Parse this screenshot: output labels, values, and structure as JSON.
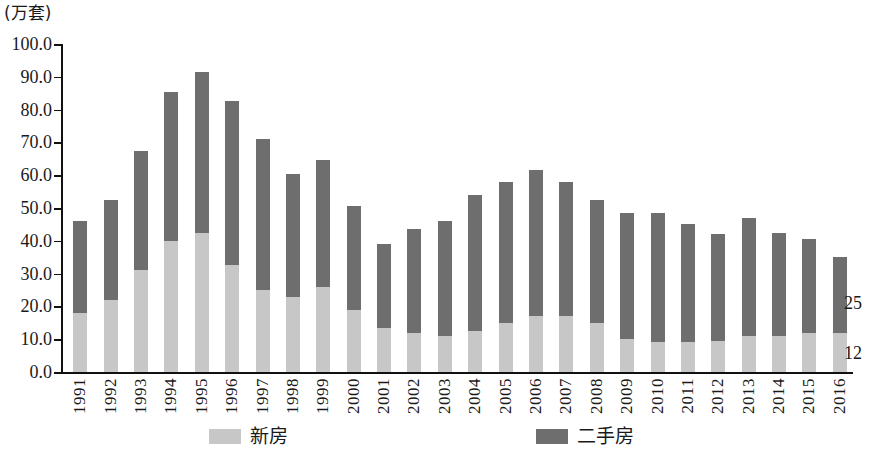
{
  "unit_caption": "(万套)",
  "colors": {
    "new": "#c7c7c7",
    "used": "#6e6e6e",
    "axis": "#111111",
    "background": "#ffffff"
  },
  "legend": {
    "position": "bottom",
    "items": [
      {
        "label": "新房",
        "color": "#c7c7c7",
        "swatch_name": "legend-swatch-new"
      },
      {
        "label": "二手房",
        "color": "#6e6e6e",
        "swatch_name": "legend-swatch-used"
      }
    ]
  },
  "annotations": [
    {
      "name": "annotation-used-2016",
      "text": "25"
    },
    {
      "name": "annotation-new-2016",
      "text": "12"
    }
  ],
  "y_axis": {
    "ticks": [
      "0.0",
      "10.0",
      "20.0",
      "30.0",
      "40.0",
      "50.0",
      "60.0",
      "70.0",
      "80.0",
      "90.0",
      "100.0"
    ],
    "min": 0,
    "max": 100,
    "step": 10
  },
  "chart_data": {
    "type": "bar",
    "stacked": true,
    "title": "",
    "subtitle": "",
    "xlabel": "",
    "ylabel": "(万套)",
    "ylim": [
      0,
      100
    ],
    "ytick_step": 10,
    "grid": false,
    "legend_position": "bottom",
    "categories": [
      "1991",
      "1992",
      "1993",
      "1994",
      "1995",
      "1996",
      "1997",
      "1998",
      "1999",
      "2000",
      "2001",
      "2002",
      "2003",
      "2004",
      "2005",
      "2006",
      "2007",
      "2008",
      "2009",
      "2010",
      "2011",
      "2012",
      "2013",
      "2014",
      "2015",
      "2016"
    ],
    "series": [
      {
        "name": "新房",
        "color": "#c7c7c7",
        "values": [
          18,
          22,
          31,
          40,
          42.5,
          32.5,
          25,
          23,
          26,
          19,
          13.5,
          12,
          11,
          12.5,
          15,
          17,
          17,
          15,
          10,
          9,
          9,
          9.5,
          11,
          11,
          12,
          12
        ]
      },
      {
        "name": "二手房",
        "color": "#6e6e6e",
        "values": [
          28,
          30.5,
          36.5,
          45.5,
          49,
          50,
          46,
          37.5,
          38.5,
          31.5,
          25.5,
          31.5,
          35,
          41.5,
          43,
          44.5,
          41,
          37.5,
          38.5,
          39.5,
          36,
          32.5,
          36,
          31.5,
          28.5,
          23
        ]
      }
    ],
    "totals": [
      46,
      52.5,
      67.5,
      85.5,
      91.5,
      82.5,
      71,
      60.5,
      64.5,
      50.5,
      39,
      43.5,
      46,
      54,
      58,
      61.5,
      58,
      52.5,
      48.5,
      48.5,
      45,
      42,
      47,
      42.5,
      40.5,
      35
    ],
    "annotations": [
      {
        "text": "25",
        "series": "二手房",
        "category": "2016",
        "value": 25
      },
      {
        "text": "12",
        "series": "新房",
        "category": "2016",
        "value": 12
      }
    ]
  }
}
